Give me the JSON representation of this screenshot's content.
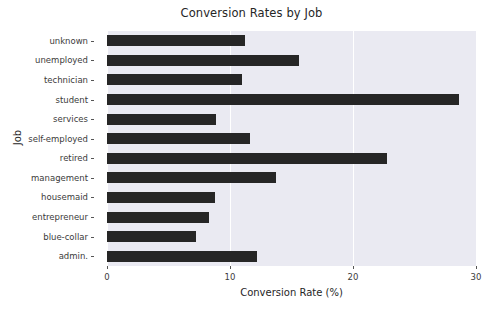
{
  "chart_data": {
    "type": "bar",
    "orientation": "horizontal",
    "title": "Conversion Rates by Job",
    "xlabel": "Conversion Rate (%)",
    "ylabel": "Job",
    "xlim": [
      0,
      30
    ],
    "xticks": [
      0,
      10,
      20,
      30
    ],
    "xtick_labels": [
      "0",
      "10",
      "20",
      "30"
    ],
    "grid": "vertical-white-on-gray",
    "legend": "none",
    "categories": [
      "unknown",
      "unemployed",
      "technician",
      "student",
      "services",
      "self-employed",
      "retired",
      "management",
      "housemaid",
      "entrepreneur",
      "blue-collar",
      "admin."
    ],
    "values": [
      11.2,
      15.6,
      11.0,
      28.6,
      8.9,
      11.6,
      22.8,
      13.7,
      8.8,
      8.3,
      7.2,
      12.2
    ],
    "bar_color": "#262626",
    "plot_background": "#eaeaf2"
  },
  "figure": {
    "title": "Conversion Rates by Job",
    "x_axis_title": "Conversion Rate (%)",
    "y_axis_title": "Job"
  }
}
